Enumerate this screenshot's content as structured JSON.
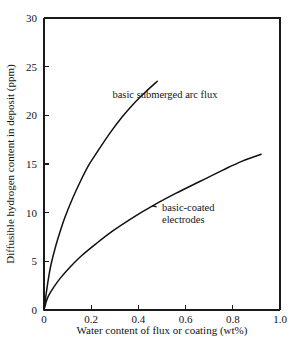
{
  "chart_data": {
    "type": "line",
    "title": "",
    "xlabel": "Water content of flux or coating (wt%)",
    "ylabel": "Diffusible hydrogen content in deposit (ppm)",
    "xlim": [
      0,
      1.0
    ],
    "ylim": [
      0,
      30
    ],
    "xticks": [
      0,
      0.2,
      0.4,
      0.6,
      0.8,
      1.0
    ],
    "xtick_labels": [
      "0",
      "0.2",
      "0.4",
      "0.6",
      "0.8",
      "1.0"
    ],
    "yticks": [
      0,
      5,
      10,
      15,
      20,
      25,
      30
    ],
    "ytick_labels": [
      "0",
      "5",
      "10",
      "15",
      "20",
      "25",
      "30"
    ],
    "grid": false,
    "legend_position": "inline-annotation",
    "series": [
      {
        "name": "basic submerged arc flux",
        "label": "basic submerged arc flux",
        "color": "#111111",
        "x": [
          0.0,
          0.01,
          0.02,
          0.03,
          0.05,
          0.07,
          0.09,
          0.12,
          0.15,
          0.19,
          0.23,
          0.28,
          0.33,
          0.38,
          0.43,
          0.48
        ],
        "y": [
          0.0,
          1.8,
          3.4,
          4.7,
          6.6,
          8.2,
          9.6,
          11.4,
          13.0,
          14.9,
          16.4,
          18.2,
          19.8,
          21.2,
          22.4,
          23.5
        ]
      },
      {
        "name": "basic-coated electrodes",
        "label": "basic-coated electrodes",
        "color": "#111111",
        "x": [
          0.0,
          0.01,
          0.02,
          0.04,
          0.07,
          0.11,
          0.16,
          0.22,
          0.29,
          0.37,
          0.46,
          0.56,
          0.66,
          0.76,
          0.84,
          0.92
        ],
        "y": [
          0.0,
          0.9,
          1.5,
          2.3,
          3.3,
          4.4,
          5.6,
          6.8,
          8.1,
          9.4,
          10.7,
          12.0,
          13.2,
          14.4,
          15.3,
          16.0
        ]
      }
    ],
    "annotations": [
      {
        "text": "basic submerged arc flux",
        "for_series": "basic submerged arc flux",
        "at_x": 0.29,
        "at_y": 21.8
      },
      {
        "text": "basic-coated electrodes",
        "for_series": "basic-coated electrodes",
        "at_x": 0.5,
        "at_y": 10.2
      }
    ]
  }
}
